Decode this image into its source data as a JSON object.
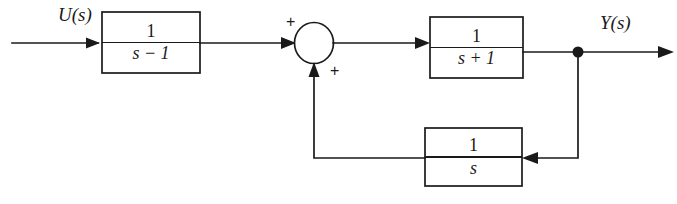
{
  "figure": {
    "kind": "control-system-block-diagram",
    "width": 677,
    "height": 204,
    "background_color": "#ffffff",
    "line_color": "#1a1a1a"
  },
  "signals": {
    "input_label": "U(s)",
    "output_label": "Y(s)"
  },
  "blocks": [
    {
      "id": "forward-block-1",
      "numerator": "1",
      "denominator": "s − 1",
      "transfer_function": "1/(s-1)"
    },
    {
      "id": "forward-block-2",
      "numerator": "1",
      "denominator": "s + 1",
      "transfer_function": "1/(s+1)"
    },
    {
      "id": "feedback-block",
      "numerator": "1",
      "denominator": "s",
      "transfer_function": "1/s"
    }
  ],
  "summing_junction": {
    "id": "summing-junction",
    "sign_top_left": "+",
    "sign_bottom_right": "+"
  },
  "takeoff_node": {
    "id": "output-takeoff-node"
  }
}
